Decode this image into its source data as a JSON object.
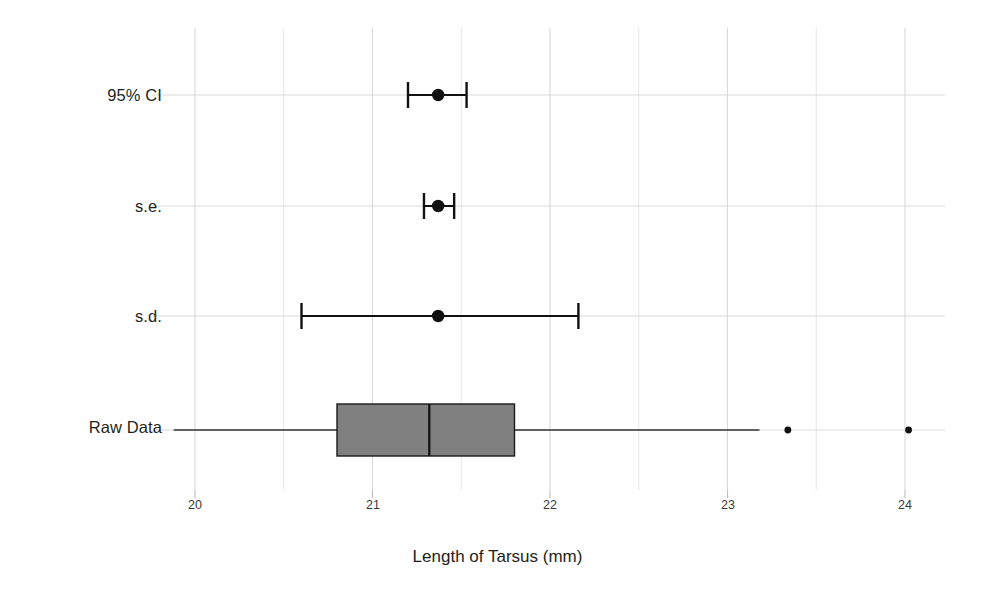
{
  "chart_data": {
    "type": "box",
    "title": "",
    "xlabel": "Length of Tarsus (mm)",
    "ylabel": "",
    "xlim": [
      19.75,
      24.35
    ],
    "xticks": [
      20,
      21,
      22,
      23,
      24
    ],
    "xtick_labels": [
      "20",
      "21",
      "22",
      "23",
      "24"
    ],
    "minor_gridlines": [
      20.5,
      21.5,
      22.5,
      23.5
    ],
    "grid": true,
    "legend": "none",
    "categories": [
      "95% CI",
      "s.e.",
      "s.d.",
      "Raw Data"
    ],
    "series": [
      {
        "name": "95% CI",
        "kind": "errorbar",
        "center": 21.37,
        "lower": 21.2,
        "upper": 21.53
      },
      {
        "name": "s.e.",
        "kind": "errorbar",
        "center": 21.37,
        "lower": 21.29,
        "upper": 21.46
      },
      {
        "name": "s.d.",
        "kind": "errorbar",
        "center": 21.37,
        "lower": 20.6,
        "upper": 22.16
      },
      {
        "name": "Raw Data",
        "kind": "boxplot",
        "whisker_low": 19.88,
        "q1": 20.8,
        "median": 21.32,
        "q3": 21.8,
        "whisker_high": 23.18,
        "outliers": [
          23.34,
          24.02
        ]
      }
    ],
    "colors": {
      "box_fill": "#808080",
      "box_edge": "#1a1a1a",
      "marker": "#111111",
      "gridline": "#d9d9d9",
      "background": "#ffffff"
    }
  },
  "axis": {
    "x_title": "Length of Tarsus (mm)",
    "tick_20": "20",
    "tick_21": "21",
    "tick_22": "22",
    "tick_23": "23",
    "tick_24": "24"
  },
  "categories": {
    "ci": "95% CI",
    "se": "s.e.",
    "sd": "s.d.",
    "raw": "Raw Data"
  }
}
